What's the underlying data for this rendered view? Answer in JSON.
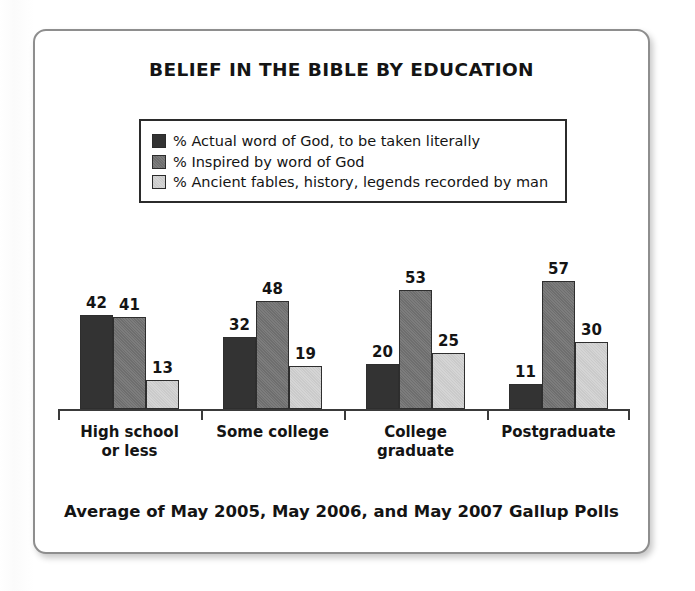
{
  "card": {
    "title": "BELIEF IN THE BIBLE BY EDUCATION",
    "footer": "Average of May 2005, May 2006, and May 2007 Gallup Polls",
    "border_color": "#8e8e8e",
    "background": "#ffffff"
  },
  "legend": {
    "items": [
      {
        "label": "% Actual word of God, to be taken literally",
        "color": "#333333",
        "swatch_icon": "legend-swatch-dark"
      },
      {
        "label": "% Inspired by word of God",
        "color": "#6e6e6e",
        "swatch_icon": "legend-swatch-medium"
      },
      {
        "label": "% Ancient fables, history, legends recorded by man",
        "color": "#d5d5d5",
        "swatch_icon": "legend-swatch-light"
      }
    ]
  },
  "chart_data": {
    "type": "bar",
    "title": "BELIEF IN THE BIBLE BY EDUCATION",
    "subtitle": "Average of May 2005, May 2006, and May 2007 Gallup Polls",
    "xlabel": "",
    "ylabel": "",
    "ylim": [
      0,
      60
    ],
    "grid": false,
    "legend_position": "top-center",
    "categories": [
      "High school\nor less",
      "Some college",
      "College\ngraduate",
      "Postgraduate"
    ],
    "category_lines": [
      [
        "High school",
        "or less"
      ],
      [
        "Some college",
        ""
      ],
      [
        "College",
        "graduate"
      ],
      [
        "Postgraduate",
        ""
      ]
    ],
    "series": [
      {
        "name": "% Actual word of God, to be taken literally",
        "color": "#333333",
        "values": [
          42,
          32,
          20,
          11
        ]
      },
      {
        "name": "% Inspired by word of God",
        "color": "#6e6e6e",
        "values": [
          41,
          48,
          53,
          57
        ]
      },
      {
        "name": "% Ancient fables, history, legends recorded by man",
        "color": "#d5d5d5",
        "values": [
          13,
          19,
          25,
          30
        ]
      }
    ]
  }
}
